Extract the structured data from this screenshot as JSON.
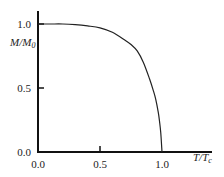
{
  "chart_data": {
    "type": "line",
    "title": "",
    "xlabel": "T/Tc",
    "ylabel": "M/M0",
    "xlim": [
      0.0,
      1.0
    ],
    "ylim": [
      0.0,
      1.0
    ],
    "grid": false,
    "legend": null,
    "x_ticks": [
      0.0,
      0.5,
      1.0
    ],
    "x_tick_labels": [
      "0.0",
      "0.5",
      "1.0"
    ],
    "y_ticks": [
      0.0,
      0.5,
      1.0
    ],
    "y_tick_labels": [
      "0.0",
      "0.5",
      "1.0"
    ],
    "series": [
      {
        "name": "Spontaneous magnetization",
        "color": "#222222",
        "x": [
          0.0,
          0.1,
          0.2,
          0.3,
          0.4,
          0.5,
          0.6,
          0.7,
          0.75,
          0.8,
          0.85,
          0.9,
          0.93,
          0.95,
          0.97,
          0.98,
          0.99,
          1.0
        ],
        "y": [
          1.0,
          1.0,
          1.0,
          0.995,
          0.985,
          0.97,
          0.935,
          0.875,
          0.84,
          0.79,
          0.7,
          0.57,
          0.48,
          0.41,
          0.31,
          0.24,
          0.15,
          0.0
        ]
      }
    ]
  },
  "labels": {
    "x_axis": {
      "main": "T/T",
      "sub": "c"
    },
    "y_axis": {
      "main": "M/M",
      "sub": "0"
    }
  }
}
